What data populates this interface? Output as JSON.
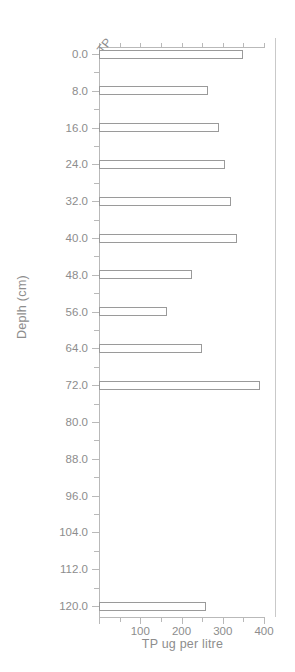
{
  "chart_data": {
    "type": "bar",
    "orientation": "horizontal",
    "title": "",
    "series_label": "TP",
    "xlabel": "TP ug per litre",
    "ylabel": "Deplh (cm)",
    "xlim": [
      0,
      400
    ],
    "ylim": [
      0,
      124
    ],
    "xticks": [
      0,
      100,
      200,
      300,
      400
    ],
    "xtick_labels": [
      "",
      "100",
      "200",
      "300",
      "400"
    ],
    "xminor_step": 50,
    "yticks": [
      0,
      8,
      16,
      24,
      32,
      40,
      48,
      56,
      64,
      72,
      80,
      88,
      96,
      104,
      112,
      120
    ],
    "ytick_labels": [
      "0.0",
      "8.0",
      "16.0",
      "24.0",
      "32.0",
      "40.0",
      "48.0",
      "56.0",
      "64.0",
      "72.0",
      "80.0",
      "88.0",
      "96.0",
      "104.0",
      "112.0",
      "120.0"
    ],
    "yminor_step": 4,
    "y_axis_inverted": true,
    "grid": false,
    "legend": false,
    "categories": [
      0,
      8,
      16,
      24,
      32,
      40,
      48,
      56,
      64,
      72,
      120
    ],
    "values": [
      350,
      265,
      290,
      305,
      320,
      335,
      225,
      165,
      250,
      390,
      260
    ],
    "bars": [
      {
        "depth": "0.0",
        "value": 350
      },
      {
        "depth": "8.0",
        "value": 265
      },
      {
        "depth": "16.0",
        "value": 290
      },
      {
        "depth": "24.0",
        "value": 305
      },
      {
        "depth": "32.0",
        "value": 320
      },
      {
        "depth": "40.0",
        "value": 335
      },
      {
        "depth": "48.0",
        "value": 225
      },
      {
        "depth": "56.0",
        "value": 165
      },
      {
        "depth": "64.0",
        "value": 250
      },
      {
        "depth": "72.0",
        "value": 390
      },
      {
        "depth": "120.0",
        "value": 260
      }
    ],
    "colors": {
      "bar_fill": "#ffffff",
      "bar_edge": "#9a9a9a",
      "axis": "#b9b9b9",
      "text": "#8d8d8d",
      "background": "#ffffff"
    }
  }
}
